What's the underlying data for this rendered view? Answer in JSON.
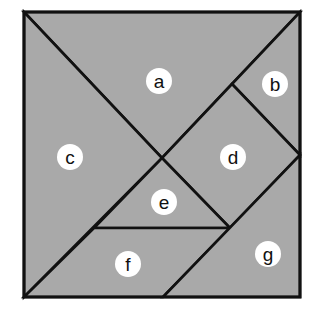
{
  "diagram": {
    "type": "tangram-square",
    "fill_color": "#a9a9a9",
    "line_color": "#111111",
    "label_bg": "#ffffff",
    "pieces": [
      {
        "label": "a",
        "shape": "large-triangle",
        "points": "24,12 300,12 162,158",
        "cx": 159,
        "cy": 81
      },
      {
        "label": "b",
        "shape": "small-triangle",
        "points": "300,12 300,155 232,84",
        "cx": 275,
        "cy": 84
      },
      {
        "label": "c",
        "shape": "large-triangle",
        "points": "24,12 162,158 24,297",
        "cx": 70,
        "cy": 157
      },
      {
        "label": "d",
        "shape": "square",
        "points": "232,84 300,155 230,228 162,158",
        "cx": 233,
        "cy": 157
      },
      {
        "label": "e",
        "shape": "small-triangle",
        "points": "162,158 230,228 94,228",
        "cx": 164,
        "cy": 202
      },
      {
        "label": "f",
        "shape": "parallelogram",
        "points": "94,228 230,228 163,297 24,297",
        "cx": 128,
        "cy": 264
      },
      {
        "label": "g",
        "shape": "medium-triangle",
        "points": "300,155 300,297 163,297",
        "cx": 268,
        "cy": 254
      }
    ]
  }
}
